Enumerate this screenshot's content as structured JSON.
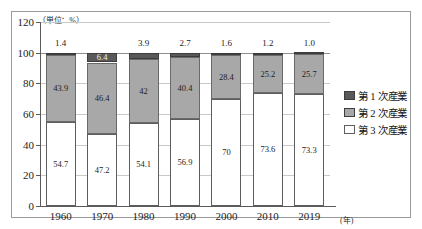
{
  "figure": {
    "unit_label": "（単位：%）",
    "x_axis_unit": "(年)"
  },
  "legend": {
    "position": "right",
    "items": [
      {
        "label": "第 1 次産業",
        "swatch": "dark-gray-swatch-icon",
        "color": "#595959"
      },
      {
        "label": "第 2 次産業",
        "swatch": "mid-gray-swatch-icon",
        "color": "#a8a8a8"
      },
      {
        "label": "第 3 次産業",
        "swatch": "white-swatch-icon",
        "color": "#ffffff"
      }
    ]
  },
  "chart_data": {
    "type": "bar",
    "stacked": true,
    "title": "",
    "subtitle": "",
    "xlabel": "(年)",
    "ylabel": "（単位：%）",
    "categories": [
      "1960",
      "1970",
      "1980",
      "1990",
      "2000",
      "2010",
      "2019"
    ],
    "ylim": [
      0,
      120
    ],
    "yticks": [
      0,
      20,
      40,
      60,
      80,
      100,
      120
    ],
    "ytick_labels": [
      "0",
      "20",
      "40",
      "60",
      "80",
      "100",
      "120"
    ],
    "grid": true,
    "legend_position": "right",
    "series": [
      {
        "name": "第 3 次産業",
        "color": "#ffffff",
        "values": [
          54.7,
          47.2,
          54.1,
          56.9,
          70,
          73.6,
          73.3
        ],
        "labels": [
          "54.7",
          "47.2",
          "54.1",
          "56.9",
          "70",
          "73.6",
          "73.3"
        ]
      },
      {
        "name": "第 2 次産業",
        "color": "#a8a8a8",
        "values": [
          43.9,
          46.4,
          42,
          40.4,
          28.4,
          25.2,
          25.7
        ],
        "labels": [
          "43.9",
          "46.4",
          "42",
          "40.4",
          "28.4",
          "25.2",
          "25.7"
        ]
      },
      {
        "name": "第 1 次産業",
        "color": "#595959",
        "values": [
          1.4,
          6.4,
          3.9,
          2.7,
          1.6,
          1.2,
          1.0
        ],
        "labels": [
          "1.4",
          "6.4",
          "3.9",
          "2.7",
          "1.6",
          "1.2",
          "1.0"
        ]
      }
    ],
    "top_labels": [
      "1.4",
      "6.4",
      "3.9",
      "2.7",
      "1.6",
      "1.2",
      "1.0"
    ]
  }
}
